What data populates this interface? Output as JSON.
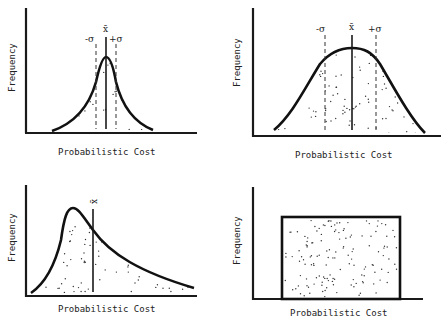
{
  "figure": {
    "panels": [
      {
        "id": "narrow-symmetric",
        "description": "Narrow, peaked symmetric distribution",
        "x_label": "Probabilistic Cost",
        "y_label": "Frequency",
        "markers": {
          "mean": "x̄",
          "minus_sigma": "-σ",
          "plus_sigma": "+σ"
        }
      },
      {
        "id": "wide-symmetric",
        "description": "Wide, flat-topped symmetric (normal) distribution",
        "x_label": "Probabilistic Cost",
        "y_label": "Frequency",
        "markers": {
          "mean": "x̄",
          "minus_sigma": "-σ",
          "plus_sigma": "+σ"
        }
      },
      {
        "id": "right-skewed",
        "description": "Right-skewed distribution, mean to the right of peak",
        "x_label": "Probabilistic Cost",
        "y_label": "Frequency",
        "markers": {
          "mean": "x̄"
        }
      },
      {
        "id": "uniform",
        "description": "Uniform (rectangular) distribution",
        "x_label": "Probabilistic Cost",
        "y_label": "Frequency",
        "markers": {}
      }
    ]
  }
}
